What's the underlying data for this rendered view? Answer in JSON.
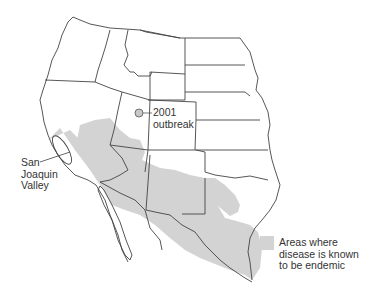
{
  "map": {
    "title": "",
    "colors": {
      "endemic_fill": "#d3d3d3",
      "border": "#444444",
      "outbreak_marker": "#c8c8c8",
      "background": "#ffffff"
    },
    "annotations": {
      "outbreak": {
        "line1": "2001",
        "line2": "outbreak"
      },
      "valley": {
        "line1": "San",
        "line2": "Joaquin",
        "line3": "Valley"
      }
    },
    "legend": {
      "line1": "Areas where",
      "line2": "disease is known",
      "line3": "to be endemic"
    }
  }
}
